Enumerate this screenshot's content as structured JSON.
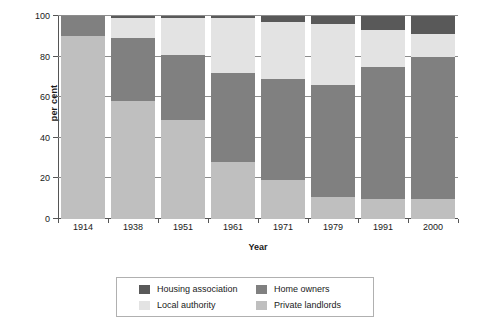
{
  "chart_data": {
    "type": "bar",
    "stacked": true,
    "title": "",
    "xlabel": "Year",
    "ylabel": "per cent",
    "categories": [
      "1914",
      "1938",
      "1951",
      "1961",
      "1971",
      "1979",
      "1991",
      "2000"
    ],
    "ylim": [
      0,
      100
    ],
    "yticks": [
      0,
      20,
      40,
      60,
      80,
      100
    ],
    "grid": true,
    "legend_position": "bottom",
    "series": [
      {
        "name": "Private landlords",
        "color": "#bfbfbf",
        "values": [
          90,
          58,
          49,
          28,
          19,
          11,
          10,
          10
        ]
      },
      {
        "name": "Home owners",
        "color": "#808080",
        "values": [
          10,
          31,
          32,
          44,
          50,
          55,
          65,
          70
        ]
      },
      {
        "name": "Local authority",
        "color": "#e3e3e3",
        "values": [
          0,
          10,
          18,
          27,
          28,
          30,
          18,
          11
        ]
      },
      {
        "name": "Housing association",
        "color": "#595959",
        "values": [
          0,
          1,
          1,
          1,
          3,
          4,
          7,
          9
        ]
      }
    ]
  },
  "axes": {
    "y_title": "per cent",
    "x_title": "Year",
    "y_tick_labels": [
      "100",
      "80",
      "60",
      "40",
      "20",
      "0"
    ],
    "x_tick_labels": [
      "1914",
      "1938",
      "1951",
      "1961",
      "1971",
      "1979",
      "1991",
      "2000"
    ]
  },
  "legend": {
    "items": [
      {
        "label": "Housing association",
        "color": "#595959"
      },
      {
        "label": "Home owners",
        "color": "#808080"
      },
      {
        "label": "Local authority",
        "color": "#e3e3e3"
      },
      {
        "label": "Private landlords",
        "color": "#bfbfbf"
      }
    ]
  }
}
